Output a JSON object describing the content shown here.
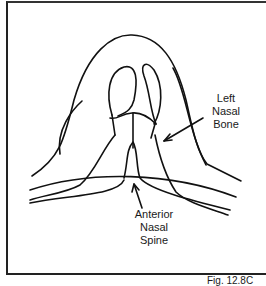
{
  "figure": {
    "caption": "Fig. 12.8C",
    "labels": {
      "left_nasal_bone": [
        "Left",
        "Nasal",
        "Bone"
      ],
      "anterior_nasal_spine": [
        "Anterior",
        "Nasal",
        "Spine"
      ]
    }
  }
}
